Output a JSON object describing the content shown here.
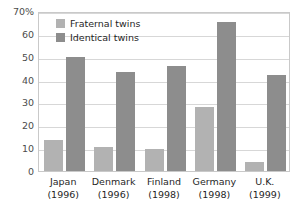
{
  "chart_data": {
    "type": "bar",
    "title": "",
    "xlabel": "",
    "ylabel": "",
    "ylim": [
      0,
      70
    ],
    "yticks": [
      {
        "value": 70,
        "label": "70%"
      },
      {
        "value": 60,
        "label": "60"
      },
      {
        "value": 50,
        "label": "50"
      },
      {
        "value": 40,
        "label": "40"
      },
      {
        "value": 30,
        "label": "30"
      },
      {
        "value": 20,
        "label": "20"
      },
      {
        "value": 10,
        "label": "10"
      },
      {
        "value": 0,
        "label": "0"
      }
    ],
    "grid": true,
    "legend_position": "top-left-inside",
    "categories": [
      "Japan",
      "Denmark",
      "Finland",
      "Germany",
      "U.K."
    ],
    "category_years": [
      "(1996)",
      "(1996)",
      "(1998)",
      "(1998)",
      "(1999)"
    ],
    "series": [
      {
        "name": "Fraternal twins",
        "color": "#b2b2b2",
        "values": [
          13.5,
          10.5,
          9.5,
          28,
          4
        ]
      },
      {
        "name": "Identical twins",
        "color": "#8d8d8d",
        "values": [
          50,
          43.5,
          46,
          65,
          42
        ]
      }
    ]
  },
  "legend": {
    "items": [
      {
        "label": "Fraternal twins"
      },
      {
        "label": "Identical twins"
      }
    ]
  },
  "colors": {
    "fraternal": "#b2b2b2",
    "identical": "#8d8d8d",
    "gridline": "#d7d7d7",
    "frame": "#c9c9c9",
    "axis_text": "#4c4c4c",
    "label_text": "#1f1f1f",
    "background": "#ffffff"
  }
}
